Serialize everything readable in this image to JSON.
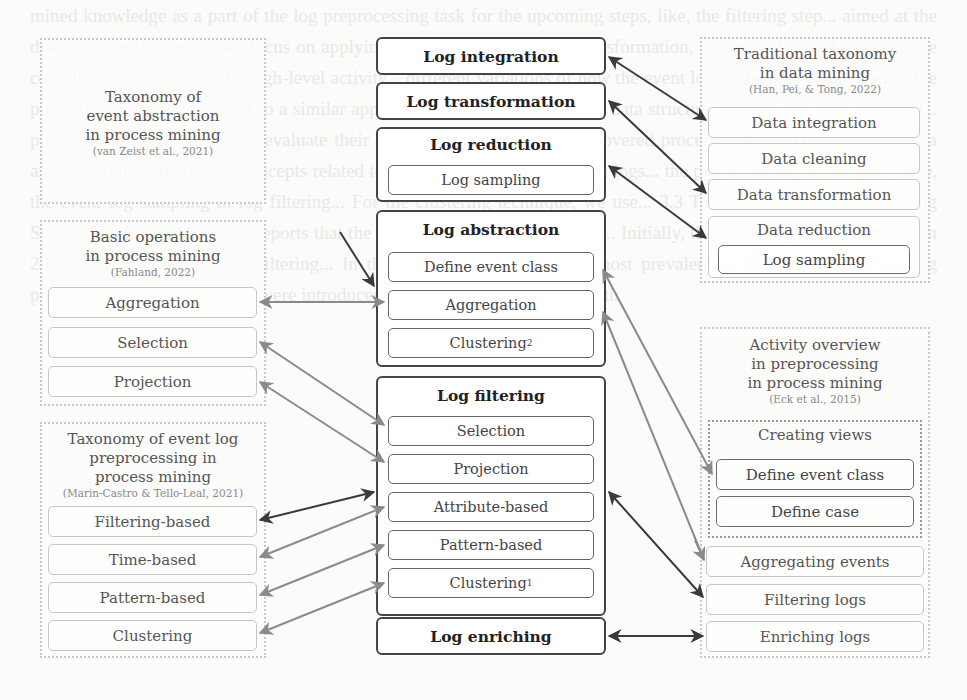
{
  "center_column": {
    "log_integration": "Log integration",
    "log_transformation": "Log transformation",
    "log_reduction": {
      "title": "Log reduction",
      "items": [
        "Log sampling"
      ]
    },
    "log_abstraction": {
      "title": "Log abstraction",
      "items": [
        "Define event class",
        "Aggregation",
        "Clustering",
        "2"
      ]
    },
    "log_filtering": {
      "title": "Log filtering",
      "items": [
        "Selection",
        "Projection",
        "Attribute-based",
        "Pattern-based",
        "Clustering",
        "1"
      ]
    },
    "log_enriching": "Log enriching"
  },
  "left_panels": {
    "event_abstraction": {
      "title": "Taxonomy of event abstraction in process mining",
      "citation": "(van Zeist et al., 2021)"
    },
    "basic_operations": {
      "title": "Basic operations in process mining",
      "citation": "(Fahland, 2022)",
      "items": [
        "Aggregation",
        "Selection",
        "Projection"
      ]
    },
    "event_log_preprocessing": {
      "title": "Taxonomy of event log preprocessing in process mining",
      "citation": "(Marin-Castro & Tello-Leal, 2021)",
      "items": [
        "Filtering-based",
        "Time-based",
        "Pattern-based",
        "Clustering"
      ]
    }
  },
  "right_panels": {
    "traditional_taxonomy": {
      "title": "Traditional taxonomy in data mining",
      "citation": "(Han, Pei, & Tong, 2022)",
      "items": [
        "Data integration",
        "Data cleaning",
        "Data transformation",
        "Data reduction",
        "Log sampling"
      ]
    },
    "activity_overview": {
      "title": "Activity overview in preprocessing in process mining",
      "citation": "(Eck et al., 2015)",
      "creating_views": {
        "title": "Creating views",
        "items": [
          "Define event class",
          "Define case"
        ]
      },
      "items": [
        "Aggregating events",
        "Filtering logs",
        "Enriching logs"
      ]
    }
  },
  "background_text": "mined knowledge as a part of the log preprocessing task for the upcoming steps, like, the filtering step... aimed at the discovery. In this sense, we focus on applying the log integration, log transformation, log reduction and reducing the complexity of the log to the high-level activity... different variations of how the event log is abstracted and used as the pure process model, we refer to a similar approach that considers the same data structure that has not been explored... preprocessing techniques and evaluate their impact on the quality of discovered process models. The event log data and constraints are given... concepts related to the data volume of the event logs... the preprocessing techniques. Here, the event log sampling in log filtering... For the clustering technique, we use... 3.3 Taxonomy-Based Preprocessing Stages. The literature review reports that the existing studies are classified... Initially, the taxonomy was introduced in 2016... data mining for log filtering... In the last decade, we see the most prevalent techniques... The event log preprocessing techniques that were introduced... and the original aspects with"
}
